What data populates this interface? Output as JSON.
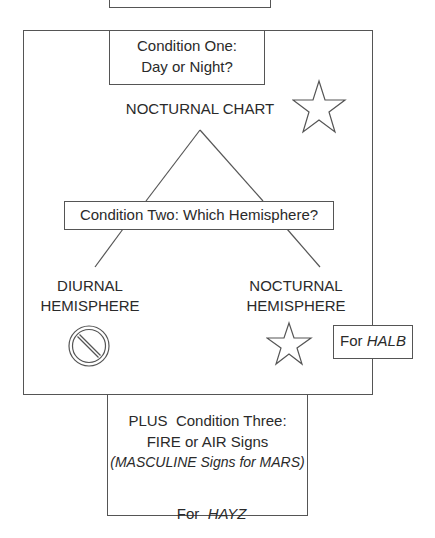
{
  "diagram": {
    "top_box": {
      "text": ""
    },
    "condition_one": {
      "line1": "Condition One:",
      "line2": "Day or Night?"
    },
    "nocturnal_chart": {
      "label": "NOCTURNAL CHART",
      "icon": "star-icon"
    },
    "condition_two": {
      "label": "Condition Two: Which Hemisphere?"
    },
    "diurnal": {
      "line1": "DIURNAL",
      "line2": "HEMISPHERE",
      "icon": "prohibited-icon"
    },
    "nocturnal": {
      "line1": "NOCTURNAL",
      "line2": "HEMISPHERE",
      "icon": "star-icon"
    },
    "halb": {
      "prefix": "For ",
      "name": "HALB"
    },
    "condition_three": {
      "line1": "PLUS  Condition Three:",
      "line2": "FIRE or AIR Signs",
      "line3": "(MASCULINE Signs for MARS)",
      "hayz_prefix": "For  ",
      "hayz_name": "HAYZ"
    },
    "colors": {
      "stroke": "#555555",
      "text": "#2a2a2a",
      "background": "#ffffff"
    }
  }
}
